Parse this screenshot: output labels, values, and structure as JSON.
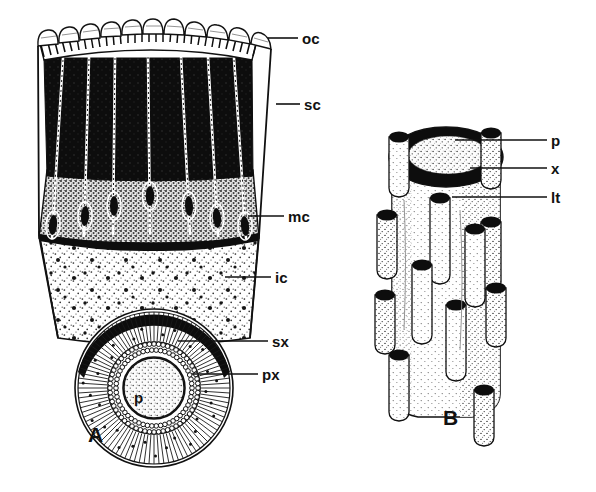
{
  "figure": {
    "background_color": "#ffffff",
    "ink_color": "#111111",
    "panels": [
      {
        "id": "A",
        "label": "A",
        "x": 88,
        "y": 424,
        "caption_role": "wedge-longitudinal-section-and-stele-cross-section"
      },
      {
        "id": "B",
        "label": "B",
        "x": 443,
        "y": 407,
        "caption_role": "stem-cylinder-with-leaf-traces"
      }
    ],
    "labels": [
      {
        "key": "oc",
        "text": "oc",
        "name": "outer-cortex",
        "text_x": 302,
        "text_y": 31,
        "leader": {
          "x1": 268,
          "y1": 38,
          "x2": 298,
          "y2": 38
        }
      },
      {
        "key": "sc",
        "text": "sc",
        "name": "sclerenchyma",
        "text_x": 304,
        "text_y": 97,
        "leader": {
          "x1": 276,
          "y1": 104,
          "x2": 300,
          "y2": 104
        }
      },
      {
        "key": "mc",
        "text": "mc",
        "name": "middle-cortex",
        "text_x": 288,
        "text_y": 209,
        "leader": {
          "x1": 248,
          "y1": 216,
          "x2": 284,
          "y2": 216
        }
      },
      {
        "key": "ic",
        "text": "ic",
        "name": "inner-cortex",
        "text_x": 275,
        "text_y": 270,
        "leader": {
          "x1": 225,
          "y1": 277,
          "x2": 271,
          "y2": 277
        }
      },
      {
        "key": "sx",
        "text": "sx",
        "name": "secondary-xylem",
        "text_x": 272,
        "text_y": 334,
        "leader": {
          "x1": 178,
          "y1": 341,
          "x2": 268,
          "y2": 341
        }
      },
      {
        "key": "px",
        "text": "px",
        "name": "primary-xylem",
        "text_x": 262,
        "text_y": 367,
        "leader": {
          "x1": 192,
          "y1": 374,
          "x2": 258,
          "y2": 374
        }
      },
      {
        "key": "p",
        "text": "p",
        "name": "pith",
        "text_x": 551,
        "text_y": 133,
        "leader": {
          "x1": 455,
          "y1": 140,
          "x2": 547,
          "y2": 140
        }
      },
      {
        "key": "x",
        "text": "x",
        "name": "xylem",
        "text_x": 551,
        "text_y": 161,
        "leader": {
          "x1": 470,
          "y1": 168,
          "x2": 547,
          "y2": 168
        }
      },
      {
        "key": "lt",
        "text": "lt",
        "name": "leaf-trace",
        "text_x": 551,
        "text_y": 190,
        "leader": {
          "x1": 452,
          "y1": 197,
          "x2": 547,
          "y2": 197
        }
      }
    ],
    "pith_labels": [
      {
        "key": "p-A",
        "text": "p",
        "name": "pith-center-A",
        "x": 134,
        "y": 390
      }
    ],
    "tissue_colors": {
      "sclerenchyma_black": "#0d0d0d",
      "middle_cortex_gray": "#9a9a9a",
      "inner_cortex_light": "#f2f2f2",
      "leaf_trace_white": "#ffffff",
      "outline": "#111111"
    }
  }
}
